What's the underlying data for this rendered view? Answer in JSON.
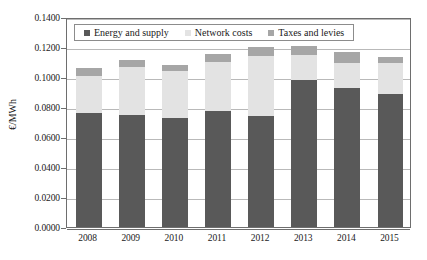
{
  "chart_data": {
    "type": "bar",
    "subtype": "stacked-vertical",
    "title": "",
    "xlabel": "",
    "ylabel": "€/MWh",
    "categories": [
      "2008",
      "2009",
      "2010",
      "2011",
      "2012",
      "2013",
      "2014",
      "2015"
    ],
    "series": [
      {
        "name": "Energy and supply",
        "color": "#595959",
        "values": [
          0.076,
          0.0745,
          0.0727,
          0.0772,
          0.0742,
          0.098,
          0.0925,
          0.089
        ]
      },
      {
        "name": "Network costs",
        "color": "#e3e3e3",
        "values": [
          0.0245,
          0.032,
          0.031,
          0.0325,
          0.04,
          0.0165,
          0.017,
          0.0205
        ]
      },
      {
        "name": "Taxes and levies",
        "color": "#a6a6a6",
        "values": [
          0.0055,
          0.005,
          0.0045,
          0.0055,
          0.0055,
          0.006,
          0.007,
          0.004
        ]
      }
    ],
    "totals": [
      0.106,
      0.1115,
      0.1082,
      0.1152,
      0.1197,
      0.1205,
      0.1165,
      0.1135
    ],
    "ylim": [
      0.0,
      0.14
    ],
    "ytick_values": [
      0.0,
      0.02,
      0.04,
      0.06,
      0.08,
      0.1,
      0.12,
      0.14
    ],
    "ytick_labels": [
      "0.0000",
      "0.0200",
      "0.0400",
      "0.0600",
      "0.0800",
      "0.1000",
      "0.1200",
      "0.1400"
    ],
    "grid": true,
    "grid_axis": "y",
    "legend_position": "top-left-inside",
    "legend": [
      "Energy and supply",
      "Network costs",
      "Taxes and levies"
    ]
  },
  "axes": {
    "y_title": "€/MWh"
  },
  "legend": {
    "items": [
      {
        "label": "Energy and supply",
        "color": "#595959"
      },
      {
        "label": "Network costs",
        "color": "#e3e3e3"
      },
      {
        "label": "Taxes and levies",
        "color": "#a6a6a6"
      }
    ]
  }
}
